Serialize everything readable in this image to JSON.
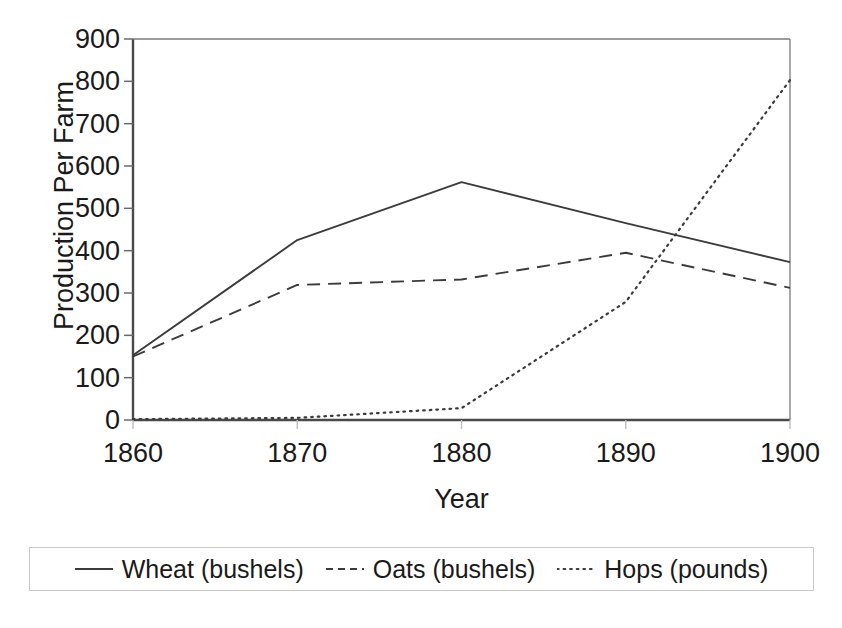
{
  "chart_data": {
    "type": "line",
    "title": "",
    "xlabel": "Year",
    "ylabel": "Production Per Farm",
    "x": [
      1860,
      1870,
      1880,
      1890,
      1900
    ],
    "xtick_labels": [
      "1860",
      "1870",
      "1880",
      "1890",
      "1900"
    ],
    "ytick_labels": [
      "0",
      "100",
      "200",
      "300",
      "400",
      "500",
      "600",
      "700",
      "800",
      "900"
    ],
    "yticks": [
      0,
      100,
      200,
      300,
      400,
      500,
      600,
      700,
      800,
      900
    ],
    "xlim": [
      1860,
      1900
    ],
    "ylim": [
      0,
      900
    ],
    "grid": false,
    "legend_position": "bottom",
    "series": [
      {
        "name": "Wheat (bushels)",
        "label": "Wheat (bushels)",
        "style": "solid",
        "color": "#3b3b3b",
        "values": [
          153,
          425,
          562,
          465,
          373
        ]
      },
      {
        "name": "Oats (bushels)",
        "label": "Oats (bushels)",
        "style": "dashed",
        "color": "#3b3b3b",
        "values": [
          150,
          319,
          332,
          395,
          312
        ]
      },
      {
        "name": "Hops (pounds)",
        "label": "Hops (pounds)",
        "style": "dotted",
        "color": "#3b3b3b",
        "values": [
          2,
          5,
          28,
          279,
          803
        ]
      }
    ]
  },
  "legend": {
    "entries": [
      {
        "label": "Wheat (bushels)",
        "style": "solid"
      },
      {
        "label": "Oats (bushels)",
        "style": "dashed"
      },
      {
        "label": "Hops (pounds)",
        "style": "dotted"
      }
    ]
  },
  "axes": {
    "x_axis_title": "Year",
    "y_axis_title": "Production Per Farm"
  }
}
